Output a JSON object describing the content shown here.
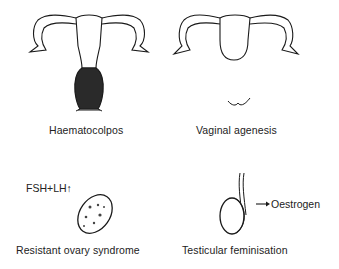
{
  "panels": [
    {
      "id": "haematocolpos",
      "caption": "Haematocolpos"
    },
    {
      "id": "vaginal-agenesis",
      "caption": "Vaginal agenesis"
    },
    {
      "id": "resistant-ovary",
      "caption": "Resistant ovary syndrome",
      "annotation": "FSH+LH",
      "annotation_arrow": "↑"
    },
    {
      "id": "testicular-feminisation",
      "caption": "Testicular feminisation",
      "annotation": "Oestrogen",
      "annotation_arrow": "→"
    }
  ],
  "colors": {
    "ink": "#1a1a1a",
    "fill_dark": "#2a2a2a",
    "background": "#ffffff"
  }
}
